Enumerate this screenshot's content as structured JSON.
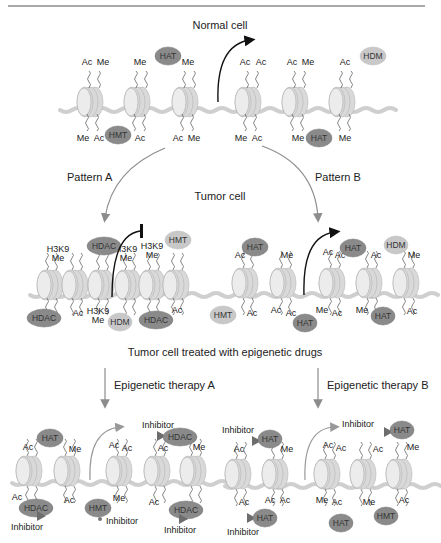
{
  "header": {
    "rule_text": "...Therapy"
  },
  "titles": {
    "normal": "Normal cell",
    "tumor": "Tumor cell",
    "treated": "Tumor cell treated with epigenetic drugs",
    "pattern_a": "Pattern A",
    "pattern_b": "Pattern B",
    "therapy_a": "Epigenetic therapy A",
    "therapy_b": "Epigenetic therapy B"
  },
  "colors": {
    "enzyme_dark": "#8a8a8a",
    "enzyme_light": "#c8c8c8",
    "nucleosome": "#d9d9d9",
    "dna": "#cfcfcf",
    "arrow_gray": "#8c8c8c",
    "arrow_black": "#111111"
  },
  "panels": {
    "normal": {
      "top_marks": [
        [
          "Ac",
          "Me"
        ],
        [
          "Me"
        ],
        [
          "Me"
        ],
        [
          "Ac",
          "Ac"
        ],
        [
          "Ac",
          "Me"
        ],
        [
          "Ac"
        ]
      ],
      "bottom_marks": [
        [
          "Me",
          "Ac"
        ],
        [
          "Ac"
        ],
        [
          "Ac",
          "Me"
        ],
        [
          "Me",
          "Ac"
        ],
        [
          "Me"
        ],
        [
          "Me"
        ]
      ],
      "enzymes": [
        "HAT",
        "HMT",
        "HAT",
        "HDM"
      ],
      "transcription": "active"
    },
    "pattern_a": {
      "top_marks": [
        "H3K9 Me",
        "H3K9 Me",
        "H3K9 Me"
      ],
      "bottom_marks": [
        "Ac",
        "H3K9 Me",
        "Ac"
      ],
      "enzymes": [
        "HDAC",
        "HMT",
        "HDAC",
        "HDM",
        "HDAC"
      ],
      "transcription": "repressed"
    },
    "pattern_b": {
      "top_marks": [
        "Ac",
        "Me",
        "Ac",
        "Ac",
        "Ac",
        "Me"
      ],
      "bottom_marks": [
        "Ac",
        "Ac",
        "Ac",
        "Me",
        "Ac",
        "Me",
        "Ac"
      ],
      "enzymes": [
        "HAT",
        "HAT",
        "HDM",
        "HMT",
        "HAT",
        "HAT"
      ],
      "transcription": "active"
    },
    "therapy_a": {
      "top_marks": [
        "Ac",
        "Me",
        "Ac",
        "Ac",
        "Ac",
        "Me"
      ],
      "bottom_marks": [
        "Ac",
        "Ac",
        "Me",
        "Ac"
      ],
      "enzymes": [
        "HAT",
        "HDAC",
        "HDAC",
        "HMT",
        "HDAC"
      ],
      "inhibitor_label": "Inhibitor"
    },
    "therapy_b": {
      "top_marks": [
        "Ac",
        "Me",
        "Ac",
        "Ac",
        "Ac",
        "Me"
      ],
      "bottom_marks": [
        "Ac",
        "Ac",
        "Ac",
        "Me",
        "Ac",
        "Me",
        "Ac"
      ],
      "enzymes": [
        "HAT",
        "HAT",
        "HAT",
        "HAT",
        "HMT"
      ],
      "inhibitor_label": "Inhibitor"
    }
  }
}
